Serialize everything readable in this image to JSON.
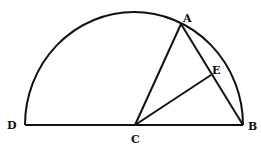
{
  "diagram": {
    "type": "geometry-semicircle",
    "points": {
      "D": {
        "label": "D",
        "x": 25,
        "y": 125
      },
      "C": {
        "label": "C",
        "x": 135,
        "y": 125
      },
      "B": {
        "label": "B",
        "x": 243,
        "y": 125
      },
      "A": {
        "label": "A",
        "x": 181,
        "y": 24
      },
      "E": {
        "label": "E",
        "x": 211,
        "y": 75
      }
    },
    "segments": [
      "DB",
      "CA",
      "AB",
      "CE"
    ],
    "arc": "semicircle DAB centered at C",
    "stroke_color": "#111111"
  }
}
